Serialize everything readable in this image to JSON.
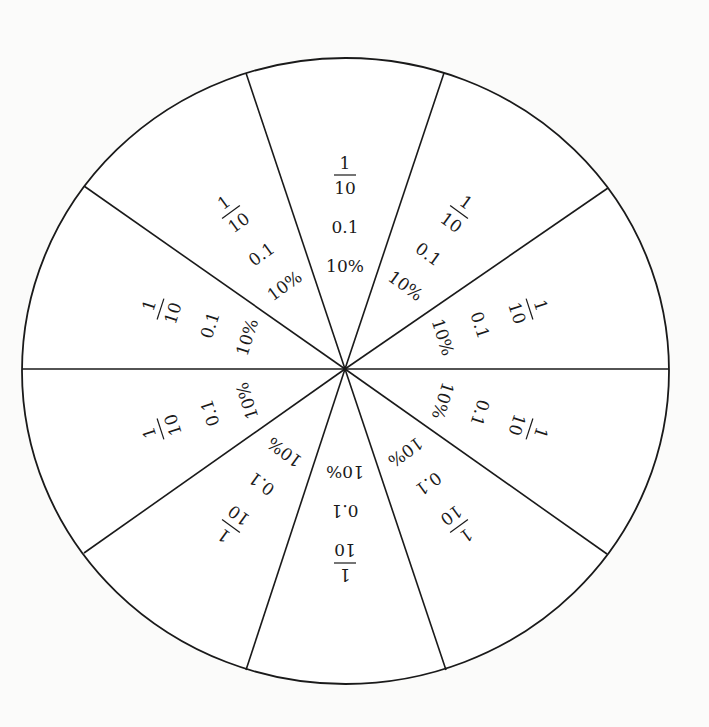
{
  "diagram": {
    "title": "",
    "type": "fraction circle",
    "sector_count": 10,
    "colors": {
      "line": "#1a1a1a",
      "fill": "#ffffff",
      "background": "#fbfbfa"
    },
    "sectors": [
      {
        "index": 0,
        "angle_deg": 0,
        "fraction_numerator": "1",
        "fraction_denominator": "10",
        "decimal": "0.1",
        "percent": "10%"
      },
      {
        "index": 1,
        "angle_deg": 36,
        "fraction_numerator": "1",
        "fraction_denominator": "10",
        "decimal": "0.1",
        "percent": "10%"
      },
      {
        "index": 2,
        "angle_deg": 72,
        "fraction_numerator": "1",
        "fraction_denominator": "10",
        "decimal": "0.1",
        "percent": "10%"
      },
      {
        "index": 3,
        "angle_deg": 108,
        "fraction_numerator": "1",
        "fraction_denominator": "10",
        "decimal": "0.1",
        "percent": "10%"
      },
      {
        "index": 4,
        "angle_deg": 144,
        "fraction_numerator": "1",
        "fraction_denominator": "10",
        "decimal": "0.1",
        "percent": "10%"
      },
      {
        "index": 5,
        "angle_deg": 180,
        "fraction_numerator": "1",
        "fraction_denominator": "10",
        "decimal": "0.1",
        "percent": "10%"
      },
      {
        "index": 6,
        "angle_deg": 216,
        "fraction_numerator": "1",
        "fraction_denominator": "10",
        "decimal": "0.1",
        "percent": "10%"
      },
      {
        "index": 7,
        "angle_deg": 252,
        "fraction_numerator": "1",
        "fraction_denominator": "10",
        "decimal": "0.1",
        "percent": "10%"
      },
      {
        "index": 8,
        "angle_deg": 288,
        "fraction_numerator": "1",
        "fraction_denominator": "10",
        "decimal": "0.1",
        "percent": "10%"
      },
      {
        "index": 9,
        "angle_deg": 324,
        "fraction_numerator": "1",
        "fraction_denominator": "10",
        "decimal": "0.1",
        "percent": "10%"
      }
    ]
  }
}
